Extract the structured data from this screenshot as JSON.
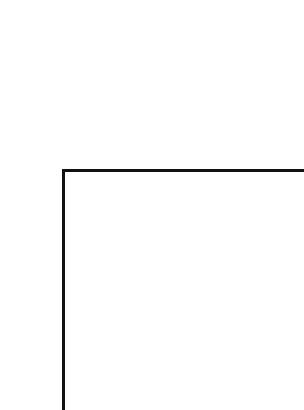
{
  "canvas": {
    "background": "#ffffff",
    "width": 304,
    "height": 410
  },
  "shapes": [
    {
      "type": "line",
      "orientation": "horizontal",
      "color": "#111111",
      "x1": 62,
      "y1": 170,
      "x2": 304,
      "y2": 170,
      "thickness": 3
    },
    {
      "type": "line",
      "orientation": "vertical",
      "color": "#111111",
      "x1": 63,
      "y1": 169,
      "x2": 63,
      "y2": 410,
      "thickness": 3
    }
  ]
}
